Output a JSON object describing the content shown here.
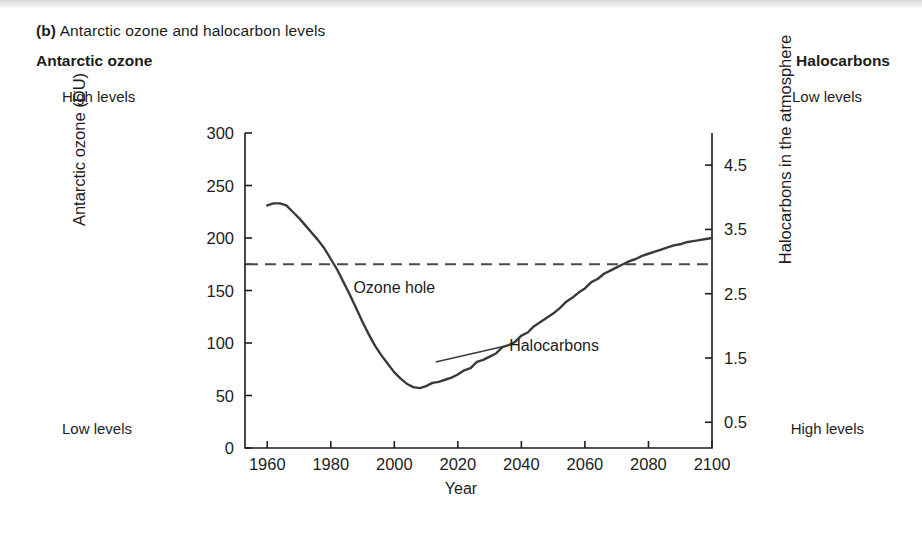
{
  "figure": {
    "label": "(b)",
    "caption": " Antarctic ozone and halocarbon levels"
  },
  "headings": {
    "left": "Antarctic ozone",
    "right": "Halocarbons"
  },
  "corner_labels": {
    "top_left": "High levels",
    "top_right": "Low levels",
    "bottom_left": "Low levels",
    "bottom_right": "High levels"
  },
  "annotations": {
    "ozone_hole": "Ozone hole",
    "halocarbons": "Halocarbons"
  },
  "colors": {
    "line": "#3a3a3a",
    "axis": "#1d1d1d",
    "dashed": "#4a4a4a",
    "background": "#ffffff"
  },
  "chart_data": {
    "type": "line",
    "title": "Antarctic ozone and halocarbon levels",
    "xlabel": "Year",
    "ylabel": "Antarctic ozone (DU)",
    "y2label": "Halocarbons in the atmosphere",
    "xlim": [
      1953,
      2100
    ],
    "ylim": [
      0,
      300
    ],
    "y2lim": [
      5.0,
      0.1
    ],
    "grid": false,
    "legend": "none",
    "xticks": [
      1960,
      1980,
      2000,
      2020,
      2040,
      2060,
      2080,
      2100
    ],
    "xtick_labels": [
      "1960",
      "1980",
      "2000",
      "2020",
      "2040",
      "2060",
      "2080",
      "2100"
    ],
    "yticks": [
      0,
      50,
      100,
      150,
      200,
      250,
      300
    ],
    "ytick_labels": [
      "0",
      "50",
      "100",
      "150",
      "200",
      "250",
      "300"
    ],
    "y2ticks": [
      0.5,
      1.5,
      2.5,
      3.5,
      4.5
    ],
    "y2tick_labels": [
      "0.5",
      "1.5",
      "2.5",
      "3.5",
      "4.5"
    ],
    "reference_line": {
      "y": 175,
      "style": "dashed",
      "label": ""
    },
    "annotations": [
      {
        "text": "Ozone hole",
        "x": 2000,
        "y": 148
      },
      {
        "text": "Halocarbons",
        "x": 2033,
        "y": 92,
        "leader_to": {
          "x": 2013,
          "y": 82
        }
      }
    ],
    "series": [
      {
        "name": "Antarctic ozone / halocarbons",
        "x": [
          1960,
          1962,
          1964,
          1966,
          1968,
          1970,
          1972,
          1974,
          1976,
          1978,
          1980,
          1982,
          1984,
          1986,
          1988,
          1990,
          1992,
          1994,
          1996,
          1998,
          2000,
          2002,
          2004,
          2006,
          2008,
          2010,
          2012,
          2014,
          2016,
          2018,
          2020,
          2022,
          2024,
          2026,
          2028,
          2030,
          2032,
          2034,
          2036,
          2038,
          2040,
          2042,
          2044,
          2046,
          2048,
          2050,
          2052,
          2054,
          2056,
          2058,
          2060,
          2062,
          2064,
          2066,
          2068,
          2070,
          2072,
          2074,
          2076,
          2078,
          2080,
          2082,
          2084,
          2086,
          2088,
          2090,
          2092,
          2094,
          2096,
          2098,
          2100
        ],
        "y": [
          231,
          233,
          233,
          231,
          225,
          219,
          212,
          205,
          198,
          190,
          180,
          170,
          158,
          146,
          133,
          120,
          108,
          97,
          88,
          80,
          72,
          66,
          61,
          58,
          57,
          59,
          62,
          63,
          65,
          67,
          70,
          74,
          76,
          82,
          84,
          87,
          90,
          96,
          98,
          101,
          107,
          110,
          116,
          120,
          124,
          128,
          133,
          139,
          143,
          148,
          152,
          158,
          161,
          166,
          169,
          172,
          175,
          178,
          180,
          183,
          185,
          187,
          189,
          191,
          193,
          194,
          196,
          197,
          198,
          199,
          200
        ]
      }
    ]
  }
}
